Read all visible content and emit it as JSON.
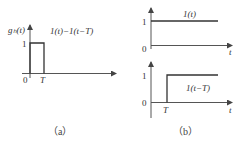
{
  "panel_a": {
    "y_label": "gₕ(t)",
    "curve_label": "1(t)−1(t−T)",
    "y_tick": "1",
    "x_ticks": [
      "0",
      "T"
    ],
    "caption": "（a）"
  },
  "panel_b_top": {
    "curve_label": "1(t)",
    "y_tick": "1",
    "origin": "0",
    "x_axis_label": "t"
  },
  "panel_b_bottom": {
    "curve_label": "1(t−T)",
    "y_tick": "1",
    "origin": "0",
    "x_tick": "T",
    "x_axis_label": "t"
  },
  "caption_b": "（b）",
  "colors": {
    "line": "#333333",
    "axis": "#555555"
  }
}
